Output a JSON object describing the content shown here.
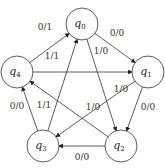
{
  "diagram": {
    "type": "state-machine",
    "states": [
      {
        "id": "q0",
        "name": "q",
        "sub": "0",
        "x": 82,
        "y": 24
      },
      {
        "id": "q1",
        "name": "q",
        "sub": "1",
        "x": 148,
        "y": 72
      },
      {
        "id": "q2",
        "name": "q",
        "sub": "2",
        "x": 121,
        "y": 146
      },
      {
        "id": "q3",
        "name": "q",
        "sub": "3",
        "x": 43,
        "y": 146
      },
      {
        "id": "q4",
        "name": "q",
        "sub": "4",
        "x": 17,
        "y": 72
      }
    ],
    "transitions": [
      {
        "from": "q4",
        "to": "q0",
        "label": "0/1"
      },
      {
        "from": "q0",
        "to": "q1",
        "label": "0/0"
      },
      {
        "from": "q0",
        "to": "q2",
        "label": "1/0"
      },
      {
        "from": "q4",
        "to": "q1",
        "label": "1/1"
      },
      {
        "from": "q1",
        "to": "q3",
        "label": "1/0"
      },
      {
        "from": "q2",
        "to": "q4",
        "label": "1/0"
      },
      {
        "from": "q3",
        "to": "q0",
        "label": "1/1"
      },
      {
        "from": "q3",
        "to": "q4",
        "label": "0/0"
      },
      {
        "from": "q1",
        "to": "q2",
        "label": "0/0"
      },
      {
        "from": "q2",
        "to": "q3",
        "label": "0/0"
      }
    ]
  }
}
